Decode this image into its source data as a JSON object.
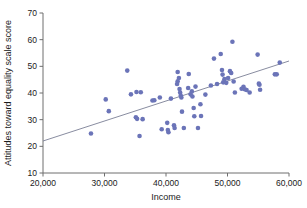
{
  "chart_data": {
    "type": "scatter",
    "title": "",
    "xlabel": "Income",
    "ylabel": "Attitudes toward equality scale score",
    "xlim": [
      20000,
      60000
    ],
    "ylim": [
      10,
      70
    ],
    "xticks": [
      20000,
      30000,
      40000,
      50000,
      60000
    ],
    "xtick_labels": [
      "20,000",
      "30,000",
      "40,000",
      "50,000",
      "60,000"
    ],
    "yticks": [
      10,
      20,
      30,
      40,
      50,
      60,
      70
    ],
    "ytick_labels": [
      "10",
      "20",
      "30",
      "40",
      "50",
      "60",
      "70"
    ],
    "grid": false,
    "legend": null,
    "marker_color": "#6b74b8",
    "marker_radius": 2.3,
    "trendline": {
      "type": "linear-fit",
      "color": "#7a7f95",
      "x_start": 20000,
      "y_start": 22.0,
      "x_end": 60000,
      "y_end": 52.0
    },
    "points": [
      [
        27800,
        24.8
      ],
      [
        30200,
        37.6
      ],
      [
        30700,
        33.2
      ],
      [
        33700,
        48.4
      ],
      [
        34300,
        39.5
      ],
      [
        35100,
        30.9
      ],
      [
        35300,
        30.3
      ],
      [
        35200,
        40.4
      ],
      [
        35900,
        40.3
      ],
      [
        35700,
        23.9
      ],
      [
        36200,
        30.2
      ],
      [
        37800,
        37.2
      ],
      [
        39000,
        38.3
      ],
      [
        39300,
        26.4
      ],
      [
        40200,
        28.8
      ],
      [
        40300,
        26.1
      ],
      [
        40400,
        25.3
      ],
      [
        40800,
        37.9
      ],
      [
        41300,
        27.9
      ],
      [
        41400,
        26.9
      ],
      [
        41900,
        47.9
      ],
      [
        41900,
        44.4
      ],
      [
        42100,
        45.6
      ],
      [
        42200,
        41.5
      ],
      [
        42300,
        40.2
      ],
      [
        42400,
        39.0
      ],
      [
        42500,
        38.3
      ],
      [
        42600,
        33.0
      ],
      [
        42900,
        26.9
      ],
      [
        43700,
        47.1
      ],
      [
        44200,
        40.6
      ],
      [
        44300,
        38.7
      ],
      [
        44500,
        34.4
      ],
      [
        44600,
        31.3
      ],
      [
        44800,
        42.4
      ],
      [
        45200,
        26.9
      ],
      [
        45600,
        35.8
      ],
      [
        45700,
        31.4
      ],
      [
        46400,
        39.4
      ],
      [
        47300,
        42.8
      ],
      [
        47800,
        52.9
      ],
      [
        48300,
        43.4
      ],
      [
        48900,
        54.6
      ],
      [
        49100,
        48.6
      ],
      [
        49200,
        46.9
      ],
      [
        49300,
        44.0
      ],
      [
        49500,
        45.2
      ],
      [
        49800,
        43.8
      ],
      [
        50400,
        48.2
      ],
      [
        50600,
        47.5
      ],
      [
        50800,
        59.2
      ],
      [
        51000,
        44.3
      ],
      [
        51200,
        40.2
      ],
      [
        52300,
        41.6
      ],
      [
        52600,
        42.3
      ],
      [
        53100,
        41.1
      ],
      [
        53600,
        40.2
      ],
      [
        54900,
        54.4
      ],
      [
        55100,
        43.5
      ],
      [
        55200,
        43.1
      ],
      [
        55300,
        41.2
      ],
      [
        57700,
        47.0
      ],
      [
        58000,
        47.0
      ],
      [
        58500,
        51.4
      ],
      [
        43600,
        41.9
      ],
      [
        44000,
        39.5
      ],
      [
        38100,
        37.3
      ],
      [
        41800,
        43.4
      ],
      [
        50100,
        45.6
      ],
      [
        52800,
        41.4
      ]
    ]
  }
}
